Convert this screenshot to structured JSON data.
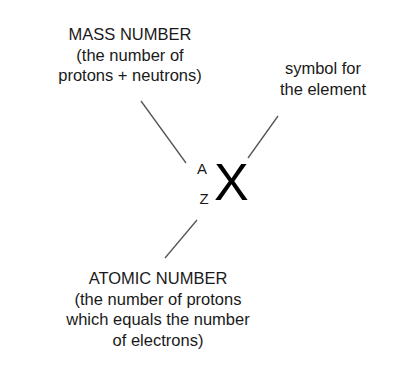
{
  "diagram": {
    "mass_number": {
      "lines": [
        "MASS NUMBER",
        "(the number of",
        "protons + neutrons)"
      ]
    },
    "symbol_label": {
      "lines": [
        "symbol for",
        "the element"
      ]
    },
    "atomic_number": {
      "lines": [
        "ATOMIC NUMBER",
        "(the number of protons",
        "which equals the number",
        "of electrons)"
      ]
    },
    "notation": {
      "superscript": "A",
      "subscript": "Z",
      "symbol": "X"
    },
    "colors": {
      "text": "#1a1a1a",
      "leader_line": "#555555",
      "background": "#ffffff"
    }
  }
}
